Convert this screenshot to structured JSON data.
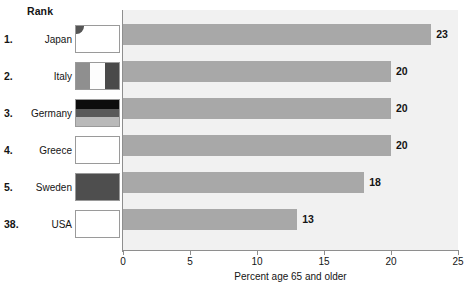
{
  "header": {
    "rank_label": "Rank"
  },
  "chart_data": {
    "type": "bar",
    "orientation": "horizontal",
    "title": "",
    "xlabel": "Percent age 65 and older",
    "ylabel": "",
    "xlim": [
      0,
      25
    ],
    "xticks": [
      0,
      5,
      10,
      15,
      20,
      25
    ],
    "xtick_labels": [
      "0",
      "5",
      "10",
      "15",
      "20",
      "25"
    ],
    "grid": false,
    "legend": "none",
    "bar_color": "#a8a8a8",
    "plot_background": "#f1f1f1",
    "categories": [
      "Japan",
      "Italy",
      "Germany",
      "Greece",
      "Sweden",
      "USA"
    ],
    "values": [
      23,
      20,
      20,
      20,
      18,
      13
    ],
    "data_labels": [
      "23",
      "20",
      "20",
      "20",
      "18",
      "13"
    ],
    "rows": [
      {
        "rank": "1.",
        "country": "Japan",
        "value": 23,
        "label": "23",
        "flag": "japan-flag-icon"
      },
      {
        "rank": "2.",
        "country": "Italy",
        "value": 20,
        "label": "20",
        "flag": "italy-flag-icon"
      },
      {
        "rank": "3.",
        "country": "Germany",
        "value": 20,
        "label": "20",
        "flag": "germany-flag-icon"
      },
      {
        "rank": "4.",
        "country": "Greece",
        "value": 20,
        "label": "20",
        "flag": "greece-flag-icon"
      },
      {
        "rank": "5.",
        "country": "Sweden",
        "value": 18,
        "label": "18",
        "flag": "sweden-flag-icon"
      },
      {
        "rank": "38.",
        "country": "USA",
        "value": 13,
        "label": "13",
        "flag": "usa-flag-icon"
      }
    ]
  },
  "footnote": ""
}
